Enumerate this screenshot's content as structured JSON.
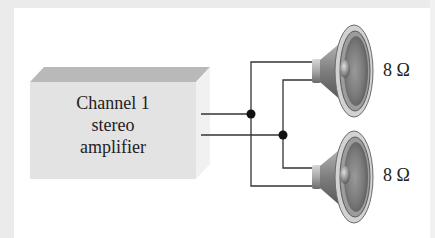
{
  "diagram": {
    "amplifier": {
      "label_lines": [
        "Channel 1",
        "stereo",
        "amplifier"
      ]
    },
    "speakers": [
      {
        "id": "speaker-top",
        "impedance_label": "8 Ω"
      },
      {
        "id": "speaker-bottom",
        "impedance_label": "8 Ω"
      }
    ],
    "connection": "parallel",
    "colors": {
      "background_frame": "#ebebeb",
      "panel": "#ffffff",
      "amp_front": "#e4e4e4",
      "amp_top": "#b8b8b8",
      "amp_side": "#f0f0f0",
      "wire": "#333333",
      "junction": "#111111"
    }
  }
}
